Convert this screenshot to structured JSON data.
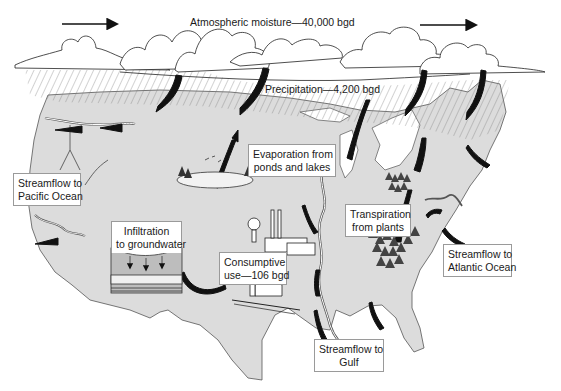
{
  "diagram": {
    "colors": {
      "land": "#dcdcdc",
      "land_stroke": "#555555",
      "lakes": "#ffffff",
      "cloud_stroke": "#222222",
      "arrow": "#111111",
      "rain_hatch": "#6d6d6d",
      "label_border": "#9a9a9a"
    },
    "labels": {
      "atmospheric_moisture": "Atmospheric moisture—40,000 bgd",
      "precipitation": "Precipitation—4,200 bgd",
      "evaporation": {
        "line1": "Evaporation from",
        "line2": "ponds and lakes"
      },
      "streamflow_pacific": {
        "line1": "Streamflow to",
        "line2": "Pacific Ocean"
      },
      "infiltration": {
        "line1": "Infiltration",
        "line2": "to groundwater"
      },
      "consumptive_use": {
        "line1": "Consumptive",
        "line2": "use—106 bgd"
      },
      "transpiration": {
        "line1": "Transpiration",
        "line2": "from plants"
      },
      "streamflow_atlantic": {
        "line1": "Streamflow to",
        "line2": "Atlantic Ocean"
      },
      "streamflow_gulf": {
        "line1": "Streamflow to",
        "line2": "Gulf"
      }
    },
    "flows": [
      {
        "name": "Atmospheric moisture",
        "value": 40000,
        "unit": "bgd"
      },
      {
        "name": "Precipitation",
        "value": 4200,
        "unit": "bgd"
      },
      {
        "name": "Consumptive use",
        "value": 106,
        "unit": "bgd"
      }
    ],
    "icons": [
      "wind-direction-arrow-icon",
      "cloud-icon",
      "rain-icon",
      "pond-icon",
      "factory-icon",
      "farm-icon",
      "forest-icon",
      "groundwater-cross-section-icon",
      "river-icon",
      "flow-arrow-icon"
    ]
  }
}
